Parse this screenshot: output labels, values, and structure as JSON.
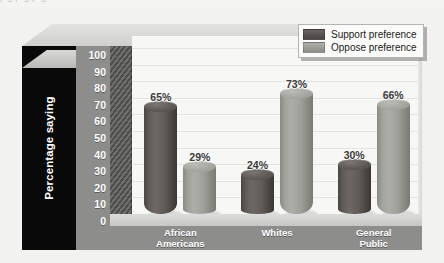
{
  "chart_data": {
    "type": "bar",
    "title": "",
    "subtitle": "",
    "xlabel": "",
    "ylabel": "Percentage saying",
    "ylim": [
      0,
      100
    ],
    "ytick_step": 10,
    "yticks": [
      "100",
      "90",
      "80",
      "70",
      "60",
      "50",
      "40",
      "30",
      "20",
      "10",
      "0"
    ],
    "grid": true,
    "legend_position": "top-right",
    "style": "3d-cylinder-grouped",
    "categories": [
      "African Americans",
      "Whites",
      "General Public"
    ],
    "category_lines": [
      [
        "African",
        "Americans"
      ],
      [
        "Whites"
      ],
      [
        "General",
        "Public"
      ]
    ],
    "series": [
      {
        "name": "Support preference",
        "key": "support",
        "color": "#5a5550",
        "values": [
          65,
          24,
          30
        ],
        "labels": [
          "65%",
          "24%",
          "30%"
        ]
      },
      {
        "name": "Oppose preference",
        "key": "oppose",
        "color": "#9b9b96",
        "values": [
          29,
          73,
          66
        ],
        "labels": [
          "29%",
          "73%",
          "66%"
        ]
      }
    ]
  },
  "legend": {
    "entries": [
      {
        "label": "Support preference",
        "swatch": "dark"
      },
      {
        "label": "Oppose preference",
        "swatch": "light"
      }
    ]
  },
  "axis": {
    "y_title": "Percentage saying"
  },
  "colors": {
    "support": "#5a5550",
    "oppose": "#9b9b96",
    "axis_title_block": "#090909",
    "tick_block": "#8d8d8b",
    "floor_front": "#8d8d8b",
    "plot_background": "#f7f7f5",
    "page_background": "#f2f2f0",
    "gridline": "#e3e3e1",
    "value_label": "#3a3a38"
  },
  "top_remnant": {
    "text": "y g p  g p  g"
  }
}
